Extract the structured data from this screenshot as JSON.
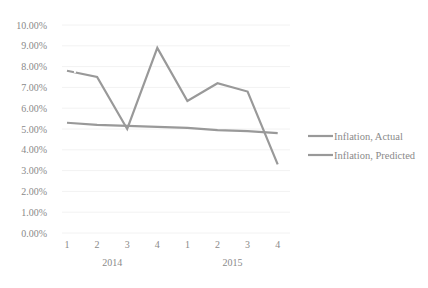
{
  "chart_data": {
    "type": "line",
    "title": "",
    "xlabel": "",
    "ylabel": "",
    "categories": [
      "1",
      "2",
      "3",
      "4",
      "1",
      "2",
      "3",
      "4"
    ],
    "category_groups": [
      {
        "label": "2014",
        "span": [
          0,
          3
        ]
      },
      {
        "label": "2015",
        "span": [
          4,
          7
        ]
      }
    ],
    "series": [
      {
        "name": "Inflation, Actual",
        "color": "#999999",
        "values": [
          7.8,
          7.5,
          5.0,
          8.9,
          6.35,
          7.2,
          6.8,
          3.3
        ]
      },
      {
        "name": "Inflation, Predicted",
        "color": "#999999",
        "values": [
          5.3,
          5.2,
          5.15,
          5.1,
          5.05,
          4.95,
          4.9,
          4.8
        ]
      }
    ],
    "yticks": [
      "0.00%",
      "1.00%",
      "2.00%",
      "3.00%",
      "4.00%",
      "5.00%",
      "6.00%",
      "7.00%",
      "8.00%",
      "9.00%",
      "10.00%"
    ],
    "ylim": [
      0,
      10
    ],
    "grid": true,
    "legend_position": "right"
  }
}
